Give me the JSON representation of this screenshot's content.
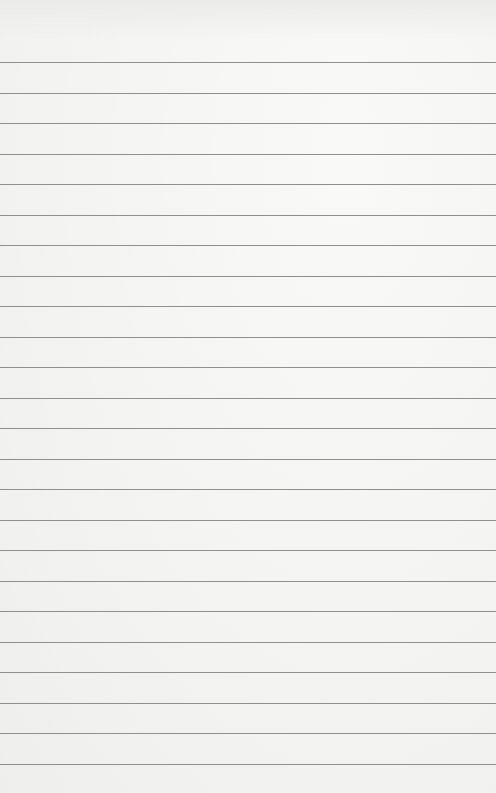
{
  "page": {
    "type": "lined-paper",
    "background_color": "#f5f5f3",
    "line_color": "#8f8f8f",
    "first_line_y": 62,
    "line_spacing": 30.5,
    "line_count": 24
  }
}
